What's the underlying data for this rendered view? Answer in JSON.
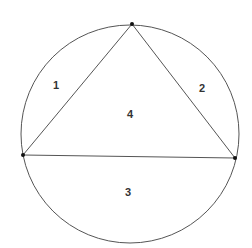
{
  "diagram": {
    "circle": {
      "cx": 130,
      "cy": 134,
      "r": 109,
      "stroke": "#555555"
    },
    "vertices": [
      {
        "name": "top",
        "x": 132,
        "y": 24
      },
      {
        "name": "left",
        "x": 23,
        "y": 155
      },
      {
        "name": "right",
        "x": 235,
        "y": 158
      }
    ],
    "regions": [
      {
        "label": "1",
        "x": 56,
        "y": 89
      },
      {
        "label": "2",
        "x": 203,
        "y": 92
      },
      {
        "label": "3",
        "x": 128,
        "y": 196
      },
      {
        "label": "4",
        "x": 131,
        "y": 118
      }
    ]
  }
}
